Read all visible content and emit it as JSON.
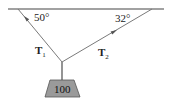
{
  "diagram": {
    "type": "statics-free-body",
    "ceiling": {
      "color": "#444444"
    },
    "cables": [
      {
        "id": "T1",
        "label_main": "T",
        "label_sub": "1",
        "angle_label": "50°",
        "side": "left"
      },
      {
        "id": "T2",
        "label_main": "T",
        "label_sub": "2",
        "angle_label": "32°",
        "side": "right"
      }
    ],
    "weight": {
      "label": "100",
      "fill": "#9a9a9a",
      "stroke": "#555555"
    },
    "colors": {
      "line": "#7a7a7a",
      "text": "#222222"
    }
  }
}
